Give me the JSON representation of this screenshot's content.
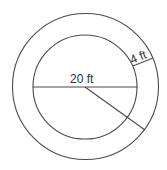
{
  "diagram": {
    "inner_diameter_label": "20 ft",
    "ring_width_label": "4 ft",
    "line_color": "#4a4a4a",
    "text_color": "#333333"
  }
}
